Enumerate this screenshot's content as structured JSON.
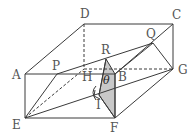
{
  "diagram": {
    "type": "cuboid-geometry",
    "colors": {
      "stroke": "#3a3a3a",
      "shade": "#c8c8c8",
      "label": "#555555"
    },
    "points": {
      "A": {
        "label": "A",
        "x": 25,
        "y": 74
      },
      "B": {
        "label": "B",
        "x": 115,
        "y": 74
      },
      "C": {
        "label": "C",
        "x": 173,
        "y": 25
      },
      "D": {
        "label": "D",
        "x": 84,
        "y": 24
      },
      "E": {
        "label": "E",
        "x": 25,
        "y": 118
      },
      "F": {
        "label": "F",
        "x": 115,
        "y": 118
      },
      "G": {
        "label": "G",
        "x": 173,
        "y": 69
      },
      "H": {
        "label": "H",
        "x": 84,
        "y": 69
      },
      "P": {
        "label": "P",
        "x": 57,
        "y": 74
      },
      "Q": {
        "label": "Q",
        "x": 153,
        "y": 43
      },
      "R": {
        "label": "R",
        "x": 106,
        "y": 59
      },
      "I": {
        "label": "I",
        "x": 99,
        "y": 95
      }
    },
    "angle_label": "θ"
  }
}
